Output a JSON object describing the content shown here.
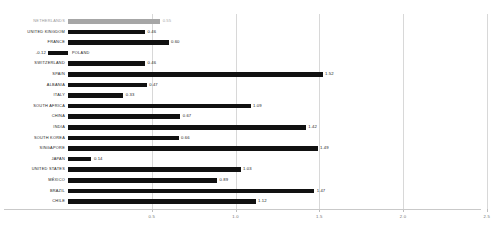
{
  "chart_data": {
    "type": "bar",
    "orientation": "horizontal",
    "title": "",
    "subtitle": "",
    "xlabel": "",
    "ylabel": "",
    "grid": true,
    "legend": false,
    "xlim": [
      -0.25,
      2.65
    ],
    "xticks": [
      0.5,
      1.0,
      1.5,
      2.0,
      2.5
    ],
    "xticklabels": [
      "0.5",
      "1.0",
      "1.5",
      "2.0",
      "2.5"
    ],
    "baseline": 0,
    "categories": [
      "NETHERLANDS",
      "UNITED KINGDOM",
      "FRANCE",
      "POLAND",
      "SWITZERLAND",
      "SPAIN",
      "ALBANIA",
      "ITALY",
      "SOUTH AFRICA",
      "CHINA",
      "INDIA",
      "SOUTH KOREA",
      "SINGAPORE",
      "JAPAN",
      "UNITED STATES",
      "MÉXICO",
      "BRAZIL",
      "CHILE"
    ],
    "values": [
      0.55,
      0.46,
      0.6,
      -0.12,
      0.46,
      1.52,
      0.47,
      0.33,
      1.09,
      0.67,
      1.42,
      0.66,
      1.49,
      0.14,
      1.03,
      0.89,
      1.47,
      1.12
    ],
    "value_labels": [
      "0.55",
      "0.46",
      "0.60",
      "-0.12",
      "0.46",
      "1.52",
      "0.47",
      "0.33",
      "1.09",
      "0.67",
      "1.42",
      "0.66",
      "1.49",
      "0.14",
      "1.03",
      "0.89",
      "1.47",
      "1.12"
    ],
    "highlight_index": 0,
    "colors": {
      "bar": "#111111",
      "highlight_bar": "#a6a6a6",
      "grid": "#d8d8d8",
      "axis": "#c9c9c9",
      "label": "#1c1c1c",
      "muted_label": "#9a9a9a",
      "tick_label": "#6f6f6f"
    }
  }
}
